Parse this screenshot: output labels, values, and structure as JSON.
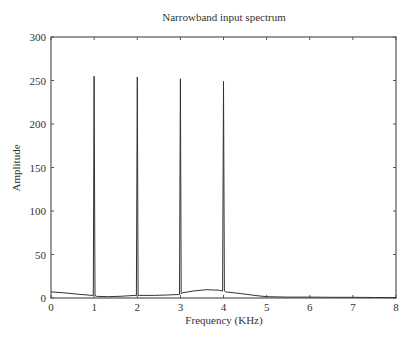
{
  "chart_data": {
    "type": "line",
    "title": "Narrowband input spectrum",
    "xlabel": "Frequency (KHz)",
    "ylabel": "Amplitude",
    "xlim": [
      0,
      8
    ],
    "ylim": [
      0,
      300
    ],
    "xticks": [
      0,
      1,
      2,
      3,
      4,
      5,
      6,
      7,
      8
    ],
    "yticks": [
      0,
      50,
      100,
      150,
      200,
      250,
      300
    ],
    "grid": false,
    "legend": "none",
    "series": [
      {
        "name": "Narrowband input spectrum",
        "x": [
          0,
          0.3,
          0.6,
          0.95,
          0.98,
          1.0,
          1.02,
          1.05,
          1.3,
          1.6,
          1.95,
          1.98,
          2.0,
          2.02,
          2.05,
          2.4,
          2.7,
          2.95,
          2.98,
          3.0,
          3.02,
          3.05,
          3.3,
          3.6,
          3.9,
          3.98,
          4.0,
          4.02,
          4.05,
          4.4,
          4.8,
          5.0,
          5.5,
          6.0,
          6.5,
          7.0,
          7.5,
          8.0
        ],
        "y": [
          7,
          6,
          4.5,
          3,
          3,
          255,
          3,
          2,
          1.5,
          2,
          3,
          3,
          254,
          3,
          3,
          3,
          3.5,
          4,
          4,
          252,
          5,
          6,
          8,
          9.5,
          9,
          8,
          249,
          8,
          7,
          5,
          2.5,
          1.5,
          1,
          1,
          0.8,
          0.8,
          0.6,
          0.5
        ]
      }
    ]
  }
}
